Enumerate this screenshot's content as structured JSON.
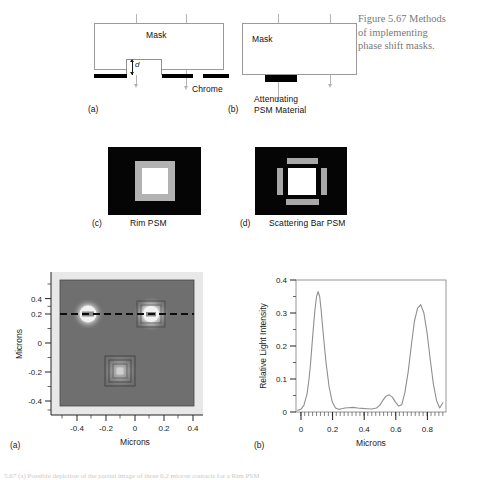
{
  "figure": {
    "caption_line1": "Figure 5.67  Methods",
    "caption_line2": "of implementing",
    "caption_line3": "phase shift masks."
  },
  "panel_a": {
    "id": "(a)",
    "mask_label": "Mask",
    "chrome_label": "Chrome",
    "depth_label": "d"
  },
  "panel_b": {
    "id": "(b)",
    "mask_label": "Mask",
    "material_line1": "Attenuating",
    "material_line2": "PSM Material"
  },
  "panel_c": {
    "id": "(c)",
    "title": "Rim PSM",
    "background_color": "#050505",
    "rim_color": "#b2b2b2",
    "aperture_color": "#ffffff"
  },
  "panel_d": {
    "id": "(d)",
    "title": "Scattering Bar PSM",
    "background_color": "#050505",
    "bar_color": "#a8a8a8",
    "aperture_color": "#ffffff"
  },
  "panel_a_plot": {
    "id": "(a)",
    "xlabel": "Microns",
    "ylabel": "Microns",
    "xticks": [
      "-0.4",
      "-0.2",
      "0",
      "0.2",
      "0.4"
    ],
    "yticks": [
      "0.4",
      "0.2",
      "0",
      "-0.2",
      "-0.4"
    ],
    "features": [
      {
        "name": "left-contact",
        "x": -0.3,
        "y": 0.2,
        "bright": true
      },
      {
        "name": "right-contact",
        "x": 0.28,
        "y": 0.2,
        "bright": true
      },
      {
        "name": "bottom-contact",
        "x": 0.0,
        "y": -0.2,
        "bright": false
      }
    ],
    "cutline_y": 0.2
  },
  "panel_b_plot": {
    "id": "(b)",
    "xlabel": "Microns",
    "ylabel": "Relative Light Intensity",
    "xticks": [
      "0",
      "0.2",
      "0.4",
      "0.6",
      "0.8"
    ],
    "yticks": [
      "0.4",
      "0.3",
      "0.2",
      "0.1",
      "0"
    ]
  },
  "chart_data": {
    "type": "line",
    "title": "",
    "xlabel": "Microns",
    "ylabel": "Relative Light Intensity",
    "xlim": [
      -0.03,
      0.92
    ],
    "ylim": [
      0,
      0.4
    ],
    "xticks": [
      0,
      0.2,
      0.4,
      0.6,
      0.8
    ],
    "yticks": [
      0,
      0.1,
      0.2,
      0.3,
      0.4
    ],
    "grid": false,
    "legend": "none",
    "series": [
      {
        "name": "Relative Light Intensity",
        "x": [
          -0.02,
          0.0,
          0.02,
          0.04,
          0.05,
          0.06,
          0.07,
          0.08,
          0.09,
          0.1,
          0.11,
          0.12,
          0.13,
          0.14,
          0.16,
          0.18,
          0.2,
          0.22,
          0.24,
          0.26,
          0.28,
          0.3,
          0.33,
          0.36,
          0.39,
          0.42,
          0.45,
          0.48,
          0.5,
          0.52,
          0.54,
          0.56,
          0.58,
          0.6,
          0.62,
          0.64,
          0.66,
          0.68,
          0.7,
          0.72,
          0.74,
          0.76,
          0.78,
          0.8,
          0.82,
          0.84,
          0.86,
          0.88,
          0.9
        ],
        "y": [
          0.005,
          0.008,
          0.02,
          0.055,
          0.09,
          0.135,
          0.195,
          0.255,
          0.31,
          0.35,
          0.365,
          0.35,
          0.305,
          0.25,
          0.15,
          0.075,
          0.03,
          0.012,
          0.008,
          0.01,
          0.012,
          0.013,
          0.014,
          0.012,
          0.011,
          0.01,
          0.009,
          0.012,
          0.02,
          0.035,
          0.048,
          0.052,
          0.045,
          0.03,
          0.018,
          0.022,
          0.06,
          0.12,
          0.2,
          0.275,
          0.315,
          0.325,
          0.3,
          0.24,
          0.16,
          0.085,
          0.035,
          0.012,
          0.028
        ]
      }
    ]
  },
  "bottom_caption": "5.67 (a) Possible depiction of the partial image of three 0.2 micron contacts for a Rim PSM"
}
